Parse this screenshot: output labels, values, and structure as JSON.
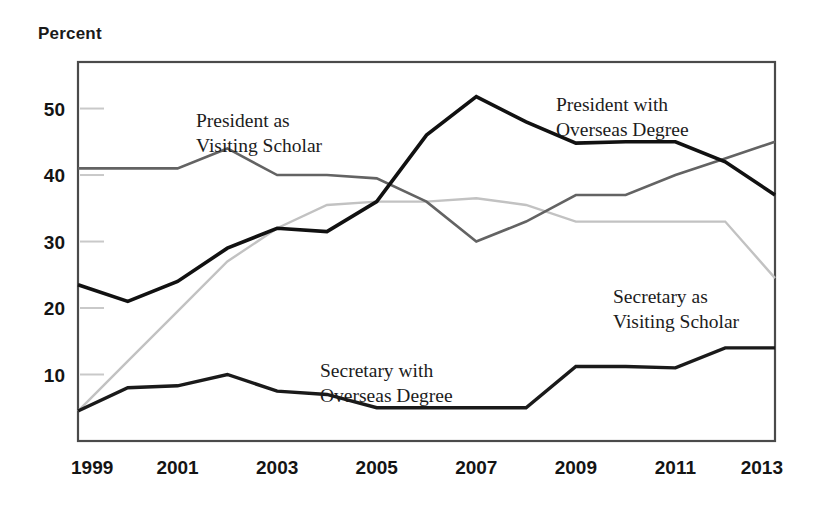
{
  "chart_data": {
    "type": "line",
    "title": "",
    "ylabel": "Percent",
    "xlabel": "",
    "grid": "y-ticks-only",
    "legend": "inline-annotations",
    "xlim": [
      1999,
      2013
    ],
    "ylim": [
      0,
      57
    ],
    "x": [
      1999,
      2000,
      2001,
      2002,
      2003,
      2004,
      2005,
      2006,
      2007,
      2008,
      2009,
      2010,
      2011,
      2012,
      2013
    ],
    "x_tick_labels": [
      "1999",
      "2001",
      "2003",
      "2005",
      "2007",
      "2009",
      "2011",
      "2013"
    ],
    "x_ticks": [
      1999,
      2001,
      2003,
      2005,
      2007,
      2009,
      2011,
      2013
    ],
    "y_ticks": [
      10,
      20,
      30,
      40,
      50
    ],
    "y_tick_labels": [
      "10",
      "20",
      "30",
      "40",
      "50"
    ],
    "series": [
      {
        "name": "President as Visiting Scholar",
        "color": "#636363",
        "values": [
          41,
          41,
          41,
          44,
          40,
          40,
          39.5,
          36,
          30,
          33,
          37,
          37,
          40,
          42.5,
          45
        ]
      },
      {
        "name": "President with Overseas Degree",
        "color": "#111111",
        "values": [
          23.5,
          21,
          24,
          29,
          32,
          31.5,
          36,
          46,
          51.8,
          48,
          44.8,
          45,
          45,
          42,
          37
        ]
      },
      {
        "name": "Secretary as Visiting Scholar",
        "color": "#c2c2c2",
        "values": [
          4.5,
          12,
          19.5,
          27,
          32,
          35.5,
          36,
          36,
          36.5,
          35.5,
          33,
          33,
          33,
          33,
          24.5
        ]
      },
      {
        "name": "Secretary with Overseas Degree",
        "color": "#1a1a1a",
        "values": [
          4.5,
          8,
          8.3,
          10,
          7.5,
          7,
          5,
          5,
          5,
          5,
          11.2,
          11.2,
          11,
          14,
          14
        ]
      }
    ],
    "annotations": [
      {
        "name": "President as Visiting Scholar",
        "lines": [
          "President as",
          "Visiting Scholar"
        ],
        "x": 196,
        "y": 127
      },
      {
        "name": "President with Overseas Degree",
        "lines": [
          "President with",
          "Overseas Degree"
        ],
        "x": 556,
        "y": 111
      },
      {
        "name": "Secretary as Visiting Scholar",
        "lines": [
          "Secretary as",
          "Visiting Scholar"
        ],
        "x": 613,
        "y": 303
      },
      {
        "name": "Secretary with Overseas Degree",
        "lines": [
          "Secretary with",
          "Overseas Degree"
        ],
        "x": 320,
        "y": 377
      }
    ]
  }
}
